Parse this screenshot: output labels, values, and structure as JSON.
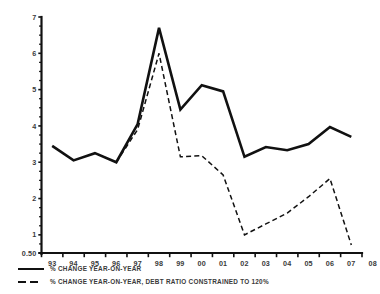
{
  "chart_data": {
    "type": "line",
    "title": "",
    "xlabel": "",
    "ylabel": "",
    "grid": false,
    "legend_position": "bottom-left",
    "categories": [
      "93",
      "94",
      "95",
      "96",
      "97",
      "98",
      "99",
      "00",
      "01",
      "02",
      "03",
      "04",
      "05",
      "06",
      "07",
      "08"
    ],
    "xlim": [
      "93",
      "08"
    ],
    "ylim": [
      0.5,
      7
    ],
    "y_tick_labels": [
      "7",
      "6",
      "5",
      "4",
      "3",
      "2",
      "1",
      "0.50"
    ],
    "y_ticks": [
      7,
      6,
      5,
      4,
      3,
      2,
      1,
      0.5
    ],
    "y_minor_step": 0.25,
    "series": [
      {
        "name": "% CHANGE YEAR-ON-YEAR",
        "style": "solid",
        "color": "#111111",
        "x": [
          "93",
          "94",
          "95",
          "96",
          "97",
          "98",
          "99",
          "00",
          "01",
          "02",
          "03",
          "04",
          "05",
          "06",
          "07"
        ],
        "values": [
          3.45,
          3.05,
          3.25,
          3.0,
          4.05,
          6.7,
          4.45,
          5.12,
          4.95,
          3.15,
          3.42,
          3.33,
          3.5,
          3.97,
          3.7
        ]
      },
      {
        "name": "% CHANGE YEAR-ON-YEAR, DEBT RATIO CONSTRAINED TO 120%",
        "style": "dashed",
        "color": "#111111",
        "x": [
          "96",
          "97",
          "98",
          "99",
          "00",
          "01",
          "02",
          "03",
          "04",
          "05",
          "06",
          "07"
        ],
        "values": [
          3.0,
          3.9,
          6.0,
          3.15,
          3.18,
          2.65,
          1.0,
          1.3,
          1.6,
          2.05,
          2.55,
          0.72
        ]
      }
    ]
  },
  "legend": {
    "items": [
      {
        "label": "% CHANGE YEAR-ON-YEAR",
        "style": "solid"
      },
      {
        "label": "% CHANGE YEAR-ON-YEAR, DEBT RATIO CONSTRAINED TO 120%",
        "style": "dashed"
      }
    ]
  }
}
